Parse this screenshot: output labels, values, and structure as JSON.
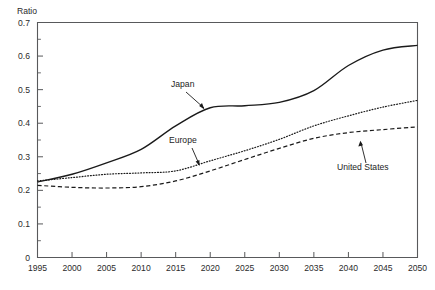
{
  "chart_data": {
    "type": "line",
    "title": "",
    "subtitle": "",
    "xlabel": "",
    "ylabel": "Ratio",
    "ylim": [
      0,
      0.7
    ],
    "xlim": [
      1995,
      2050
    ],
    "grid": false,
    "legend_position": "inline-annotations",
    "y_ticks": [
      "0",
      "0.1",
      "0.2",
      "0.3",
      "0.4",
      "0.5",
      "0.6",
      "0.7"
    ],
    "y_tick_values": [
      0,
      0.1,
      0.2,
      0.3,
      0.4,
      0.5,
      0.6,
      0.7
    ],
    "y_minor_tick_values": [
      0.05,
      0.15,
      0.25,
      0.35,
      0.45,
      0.55,
      0.65
    ],
    "x_ticks": [
      "1995",
      "2000",
      "2005",
      "2010",
      "2015",
      "2020",
      "2025",
      "2030",
      "2035",
      "2040",
      "2045",
      "2050"
    ],
    "x_tick_values": [
      1995,
      2000,
      2005,
      2010,
      2015,
      2020,
      2025,
      2030,
      2035,
      2040,
      2045,
      2050
    ],
    "x": [
      1995,
      2000,
      2005,
      2010,
      2015,
      2020,
      2025,
      2030,
      2035,
      2040,
      2045,
      2050
    ],
    "series": [
      {
        "name": "Japan",
        "style": "solid",
        "color": "#1a1a1a",
        "values": [
          0.225,
          0.248,
          0.282,
          0.322,
          0.392,
          0.446,
          0.452,
          0.462,
          0.497,
          0.572,
          0.618,
          0.632
        ]
      },
      {
        "name": "Europe",
        "style": "dotted",
        "color": "#1a1a1a",
        "values": [
          0.228,
          0.238,
          0.248,
          0.252,
          0.258,
          0.288,
          0.318,
          0.352,
          0.392,
          0.422,
          0.448,
          0.468
        ]
      },
      {
        "name": "United States",
        "style": "dashed",
        "color": "#1a1a1a",
        "values": [
          0.215,
          0.209,
          0.207,
          0.211,
          0.228,
          0.258,
          0.292,
          0.325,
          0.355,
          0.372,
          0.381,
          0.389
        ]
      }
    ],
    "annotations": [
      {
        "label": "Japan",
        "points_to_series": "Japan"
      },
      {
        "label": "Europe",
        "points_to_series": "Europe"
      },
      {
        "label": "United States",
        "points_to_series": "United States"
      }
    ]
  }
}
